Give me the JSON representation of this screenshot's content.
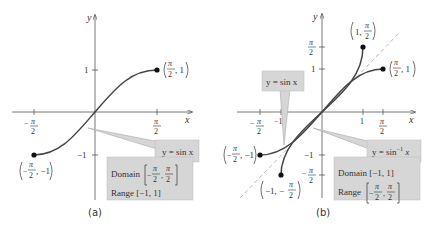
{
  "colors": {
    "axis": "#555555",
    "curve": "#444444",
    "dashed_line": "#bbbbbb",
    "callout_fill": "#d6d6d6",
    "callout_border": "#aaaaaa",
    "text": "#333333"
  },
  "panel_a": {
    "caption": "(a)",
    "x_axis_label": "x",
    "y_axis_label": "y",
    "x_ticks": [
      "-π/2",
      "π/2"
    ],
    "y_ticks": [
      "1",
      "-1"
    ],
    "curve_label": "y = sin x",
    "endpoints": [
      "(π/2, 1)",
      "(-π/2, -1)"
    ],
    "info_box": {
      "domain_label": "Domain",
      "domain_value": "[-π/2, π/2]",
      "range_label": "Range",
      "range_value": "[-1, 1]"
    }
  },
  "panel_b": {
    "caption": "(b)",
    "x_axis_label": "x",
    "y_axis_label": "y",
    "x_ticks": [
      "-π/2",
      "-1",
      "1",
      "π/2"
    ],
    "y_ticks": [
      "π/2",
      "1",
      "-1",
      "-π/2"
    ],
    "curve_label_sin": "y = sin x",
    "curve_label_arcsin": "y = sin⁻¹ x",
    "endpoints": [
      "(1, π/2)",
      "(π/2, 1)",
      "(-π/2, -1)",
      "(-1, -π/2)"
    ],
    "info_box": {
      "domain_label": "Domain",
      "domain_value": "[-1, 1]",
      "range_label": "Range",
      "range_value": "[-π/2, π/2]"
    }
  },
  "text": {
    "y": "y",
    "x": "x",
    "pi": "π",
    "two": "2",
    "one": "1",
    "neg": "−",
    "neg1": "−1",
    "comma1": ", 1",
    "comma_neg1": ", −1",
    "one_comma": "1, ",
    "neg1_comma": "−1, −",
    "comma": ",",
    "sin_lbl": "y = sin x",
    "arcsin_lbl_pre": "y = sin",
    "arcsin_sup": "−1",
    "arcsin_post": " x",
    "domain": "Domain",
    "range": "Range",
    "range_a": "Range [−1, 1]",
    "domain_b": "Domain [−1, 1]",
    "cap_a": "(a)",
    "cap_b": "(b)"
  }
}
